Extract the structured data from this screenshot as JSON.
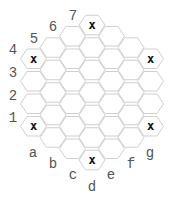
{
  "board": {
    "type": "hex-hex",
    "size": 4,
    "columns": [
      "a",
      "b",
      "c",
      "d",
      "e",
      "f",
      "g"
    ],
    "rows": [
      "1",
      "2",
      "3",
      "4",
      "5",
      "6",
      "7"
    ],
    "column_row_ranges": {
      "a": [
        1,
        4
      ],
      "b": [
        1,
        5
      ],
      "c": [
        1,
        6
      ],
      "d": [
        1,
        7
      ],
      "e": [
        1,
        6
      ],
      "f": [
        1,
        5
      ],
      "g": [
        1,
        4
      ]
    },
    "stone_symbol": "x",
    "marked_cells": [
      "a1",
      "a4",
      "d1",
      "d7",
      "g1",
      "g4"
    ],
    "colors": {
      "hex_stroke": "#cfcfcf",
      "hex_fill": "#ffffff",
      "mark": "#111111",
      "label": "#555555"
    }
  },
  "labels": {
    "rows": [
      {
        "text": "1",
        "x": 13,
        "y": 122
      },
      {
        "text": "2",
        "x": 13,
        "y": 100
      },
      {
        "text": "3",
        "x": 13,
        "y": 77
      },
      {
        "text": "4",
        "x": 13,
        "y": 54
      },
      {
        "text": "5",
        "x": 34,
        "y": 43
      },
      {
        "text": "6",
        "x": 53,
        "y": 31
      },
      {
        "text": "7",
        "x": 73,
        "y": 20
      }
    ],
    "columns": [
      {
        "text": "a",
        "x": 33,
        "y": 157
      },
      {
        "text": "b",
        "x": 53,
        "y": 168
      },
      {
        "text": "c",
        "x": 73,
        "y": 179
      },
      {
        "text": "d",
        "x": 92,
        "y": 191
      },
      {
        "text": "e",
        "x": 111,
        "y": 179
      },
      {
        "text": "f",
        "x": 131,
        "y": 168
      },
      {
        "text": "g",
        "x": 150,
        "y": 157
      }
    ]
  }
}
